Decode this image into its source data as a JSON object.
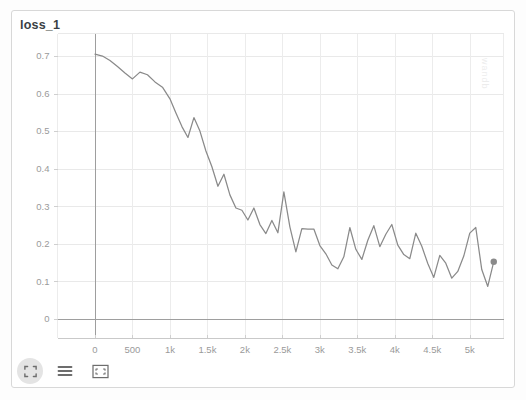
{
  "panel": {
    "title": "loss_1"
  },
  "watermark": {
    "text": "wandb"
  },
  "toolbar": {
    "items": [
      {
        "name": "expand-icon",
        "label": "Expand",
        "active": true
      },
      {
        "name": "list-icon",
        "label": "Show legend",
        "active": false
      },
      {
        "name": "fit-frame-icon",
        "label": "Fit to view",
        "active": false
      }
    ]
  },
  "chart_data": {
    "type": "line",
    "title": "loss_1",
    "xlabel": "",
    "ylabel": "",
    "grid": true,
    "legend": "none",
    "xlim": [
      -500,
      5450
    ],
    "ylim": [
      -0.05,
      0.76
    ],
    "xticks": [
      0,
      500,
      1000,
      1500,
      2000,
      2500,
      3000,
      3500,
      4000,
      4500,
      5000
    ],
    "xticklabels": [
      "0",
      "500",
      "1k",
      "1.5k",
      "2k",
      "2.5k",
      "3k",
      "3.5k",
      "4k",
      "4.5k",
      "5k"
    ],
    "yticks": [
      0,
      0.1,
      0.2,
      0.3,
      0.4,
      0.5,
      0.6,
      0.7
    ],
    "yticklabels": [
      "0",
      "0.1",
      "0.2",
      "0.3",
      "0.4",
      "0.5",
      "0.6",
      "0.7"
    ],
    "series": [
      {
        "name": "loss_1",
        "color": "#8a8a8a",
        "marker_last_point": true,
        "x": [
          0,
          100,
          200,
          300,
          400,
          500,
          600,
          700,
          800,
          900,
          1000,
          1080,
          1160,
          1240,
          1320,
          1400,
          1480,
          1560,
          1640,
          1720,
          1800,
          1880,
          1960,
          2040,
          2120,
          2200,
          2280,
          2360,
          2440,
          2520,
          2600,
          2680,
          2760,
          2840,
          2920,
          3000,
          3080,
          3160,
          3240,
          3320,
          3400,
          3480,
          3560,
          3640,
          3720,
          3800,
          3880,
          3960,
          4040,
          4120,
          4200,
          4280,
          4360,
          4440,
          4520,
          4600,
          4680,
          4760,
          4840,
          4920,
          5000,
          5080,
          5160,
          5240
        ],
        "y": [
          0.705,
          0.7,
          0.688,
          0.672,
          0.655,
          0.639,
          0.657,
          0.65,
          0.631,
          0.617,
          0.586,
          0.548,
          0.512,
          0.483,
          0.536,
          0.5,
          0.447,
          0.405,
          0.353,
          0.385,
          0.33,
          0.295,
          0.289,
          0.263,
          0.295,
          0.251,
          0.227,
          0.262,
          0.229,
          0.338,
          0.245,
          0.178,
          0.24,
          0.239,
          0.239,
          0.195,
          0.173,
          0.143,
          0.133,
          0.165,
          0.243,
          0.185,
          0.158,
          0.209,
          0.248,
          0.192,
          0.225,
          0.251,
          0.196,
          0.171,
          0.16,
          0.228,
          0.193,
          0.147,
          0.11,
          0.169,
          0.148,
          0.108,
          0.126,
          0.167,
          0.228,
          0.243,
          0.131,
          0.086
        ],
        "last_point": {
          "x": 5320,
          "y": 0.152
        }
      }
    ]
  }
}
